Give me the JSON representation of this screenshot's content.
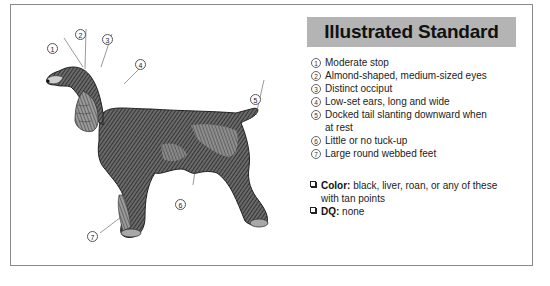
{
  "panel": {
    "title": "Illustrated Standard",
    "title_bg": "#b4b4b4",
    "features": [
      {
        "num": "1",
        "text": "Moderate stop"
      },
      {
        "num": "2",
        "text": "Almond-shaped, medium-sized eyes"
      },
      {
        "num": "3",
        "text": "Distinct occiput"
      },
      {
        "num": "4",
        "text": "Low-set ears, long and wide"
      },
      {
        "num": "5",
        "text": "Docked tail slanting downward when at rest"
      },
      {
        "num": "6",
        "text": "Little or no tuck-up"
      },
      {
        "num": "7",
        "text": "Large round webbed feet"
      }
    ],
    "notes": [
      {
        "label": "Color:",
        "text": " black, liver, roan, or any of these with tan points"
      },
      {
        "label": "DQ:",
        "text": " none"
      }
    ]
  },
  "illustration": {
    "subject": "dog-illustration",
    "callouts": [
      "1",
      "2",
      "3",
      "4",
      "5",
      "6",
      "7"
    ]
  }
}
